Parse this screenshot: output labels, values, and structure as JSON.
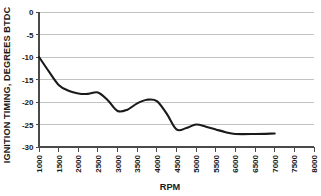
{
  "chart_data": {
    "type": "line",
    "title": "",
    "xlabel": "RPM",
    "ylabel": "IGNITION TIMING, DEGREES BTDC",
    "xlim": [
      1000,
      8000
    ],
    "ylim": [
      -30,
      0
    ],
    "grid": true,
    "legend": null,
    "x_ticks": [
      1000,
      1500,
      2000,
      2500,
      3000,
      3500,
      4000,
      4500,
      5000,
      5500,
      6000,
      6500,
      7000,
      7500,
      8000
    ],
    "x_tick_labels": [
      "1000",
      "1500",
      "2000",
      "2500",
      "3000",
      "3500",
      "4000",
      "4500",
      "5000",
      "5500",
      "6000",
      "6500",
      "7000",
      "7500",
      "8000"
    ],
    "y_ticks": [
      0,
      -5,
      -10,
      -15,
      -20,
      -25,
      -30
    ],
    "y_tick_labels": [
      "0",
      "-5",
      "-10",
      "-15",
      "-20",
      "-25",
      "-30"
    ],
    "series": [
      {
        "name": "ignition timing",
        "color": "#1a1a1a",
        "x": [
          1000,
          1250,
          1500,
          1750,
          2000,
          2250,
          2500,
          2750,
          3000,
          3250,
          3500,
          3750,
          4000,
          4250,
          4500,
          4750,
          5000,
          5250,
          5500,
          5750,
          6000,
          6500,
          7000
        ],
        "values": [
          -10.0,
          -13.2,
          -16.2,
          -17.5,
          -18.1,
          -18.2,
          -17.9,
          -19.6,
          -22.0,
          -21.7,
          -20.3,
          -19.5,
          -19.8,
          -22.6,
          -26.1,
          -25.8,
          -25.0,
          -25.5,
          -26.1,
          -26.7,
          -27.1,
          -27.1,
          -27.0
        ]
      }
    ]
  },
  "axis_labels": {
    "y_axis_title": "IGNITION TIMING, DEGREES BTDC",
    "x_axis_title": "RPM"
  },
  "colors": {
    "line": "#1a1a1a",
    "grid": "#b4b4b4",
    "axis": "#4a4a4a",
    "background": "#ffffff",
    "text": "#1a1a1a"
  }
}
